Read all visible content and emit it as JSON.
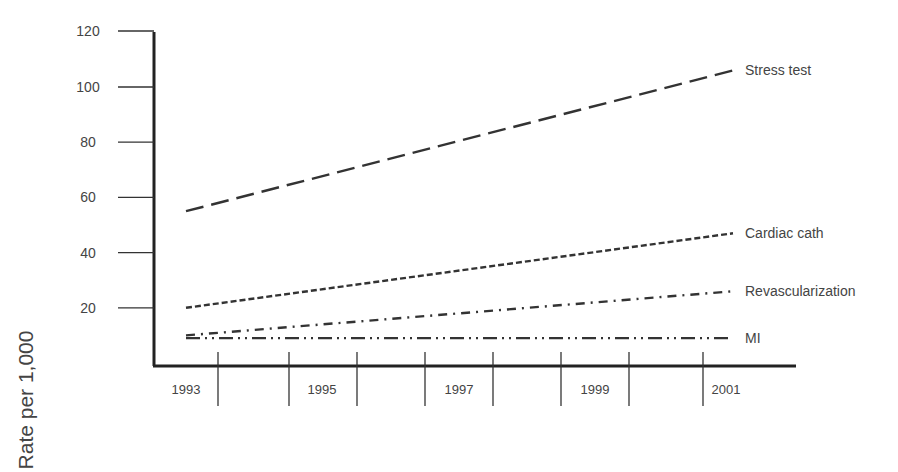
{
  "chart_data": {
    "type": "line",
    "title": "",
    "xlabel": "",
    "ylabel": "Rate per 1,000",
    "ylim": [
      0,
      120
    ],
    "yticks": [
      20,
      40,
      60,
      80,
      100,
      120
    ],
    "xtick_labels": [
      "1993",
      "1995",
      "1997",
      "1999",
      "2001"
    ],
    "x": [
      1993,
      2001
    ],
    "grid": false,
    "legend_position": "inline-right",
    "series": [
      {
        "name": "Stress test",
        "values": [
          55,
          106
        ],
        "style": "long-dash"
      },
      {
        "name": "Cardiac cath",
        "values": [
          20,
          47
        ],
        "style": "short-dash"
      },
      {
        "name": "Revascularization",
        "values": [
          10,
          26
        ],
        "style": "dash-dot"
      },
      {
        "name": "MI",
        "values": [
          9,
          9
        ],
        "style": "dash-dot-dot"
      }
    ]
  }
}
